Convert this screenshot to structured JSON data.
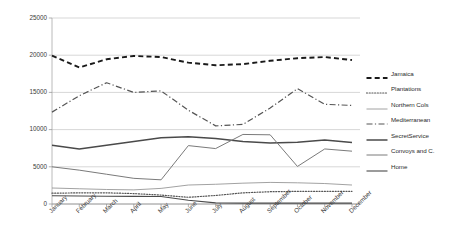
{
  "chart_data": {
    "type": "line",
    "title": "",
    "xlabel": "",
    "ylabel": "",
    "ylim": [
      0,
      25000
    ],
    "yticks": [
      0,
      5000,
      10000,
      15000,
      20000,
      25000
    ],
    "ytick_labels": [
      "0",
      "5000",
      "10000",
      "15000",
      "20000",
      "25000"
    ],
    "grid": true,
    "legend_position": "right",
    "categories": [
      "January",
      "February",
      "March",
      "April",
      "May",
      "June",
      "July",
      "August",
      "September",
      "October",
      "November",
      "December"
    ],
    "series": [
      {
        "name": "Jamaica",
        "style": "dashed",
        "color": "#1a1a1a",
        "values": [
          19950,
          18350,
          19450,
          19900,
          19750,
          19000,
          18650,
          18800,
          19250,
          19600,
          19750,
          19350
        ]
      },
      {
        "name": "Plantations",
        "style": "dotted",
        "color": "#555555",
        "values": [
          1450,
          1500,
          1500,
          1400,
          1200,
          900,
          1150,
          1500,
          1650,
          1700,
          1700,
          1700
        ]
      },
      {
        "name": "Northern Cols",
        "style": "solid-thin",
        "color": "#8a8a8a",
        "values": [
          2150,
          2050,
          1950,
          1900,
          2100,
          2550,
          2650,
          2800,
          2900,
          2850,
          2750,
          2550
        ]
      },
      {
        "name": "Mediterranean",
        "style": "dash-dot",
        "color": "#555555",
        "values": [
          12350,
          14550,
          16300,
          15000,
          15200,
          12600,
          10500,
          10700,
          12900,
          15500,
          13400,
          13250
        ]
      },
      {
        "name": "SecretService",
        "style": "solid-medium",
        "color": "#4a4a4a",
        "values": [
          7900,
          7400,
          7900,
          8400,
          8900,
          9050,
          8800,
          8400,
          8200,
          8300,
          8600,
          8250
        ]
      },
      {
        "name": "Convoys and C.",
        "style": "solid",
        "color": "#7a7a7a",
        "values": [
          5000,
          4550,
          4000,
          3450,
          3250,
          7850,
          7450,
          9350,
          9300,
          5050,
          7400,
          7100
        ]
      },
      {
        "name": "Home",
        "style": "solid-thin-flat",
        "color": "#4a4a4a",
        "values": [
          1100,
          1080,
          1050,
          1020,
          1000,
          500,
          150,
          120,
          120,
          120,
          120,
          120
        ]
      }
    ]
  }
}
